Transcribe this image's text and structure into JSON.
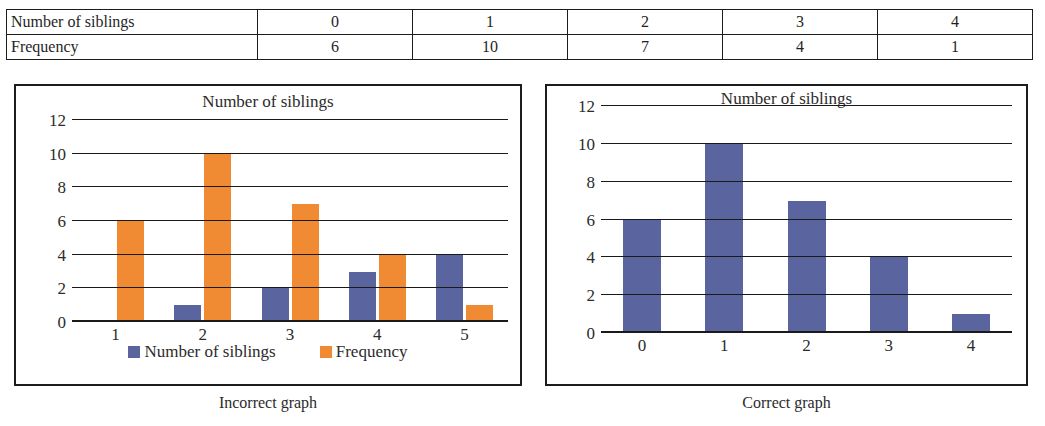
{
  "table": {
    "rows": [
      {
        "label": "Number of siblings",
        "values": [
          "0",
          "1",
          "2",
          "3",
          "4"
        ]
      },
      {
        "label": "Frequency",
        "values": [
          "6",
          "10",
          "7",
          "4",
          "1"
        ]
      }
    ]
  },
  "colors": {
    "blue": "#5a65a0",
    "orange": "#f08a33",
    "ink": "#1c1c1c"
  },
  "captions": {
    "left": "Incorrect graph",
    "right": "Correct graph"
  },
  "chart_data": [
    {
      "id": "incorrect",
      "type": "bar",
      "title": "Number of siblings",
      "xlabel": "",
      "ylabel": "",
      "categories": [
        "1",
        "2",
        "3",
        "4",
        "5"
      ],
      "yticks": [
        0,
        2,
        4,
        6,
        8,
        10,
        12
      ],
      "ylim": [
        0,
        12
      ],
      "grid": true,
      "legend": "bottom",
      "series": [
        {
          "name": "Number of siblings",
          "color": "#5a65a0",
          "values": [
            0,
            1,
            2,
            3,
            4
          ]
        },
        {
          "name": "Frequency",
          "color": "#f08a33",
          "values": [
            6,
            10,
            7,
            4,
            1
          ]
        }
      ]
    },
    {
      "id": "correct",
      "type": "bar",
      "title": "Number of siblings",
      "xlabel": "",
      "ylabel": "",
      "categories": [
        "0",
        "1",
        "2",
        "3",
        "4"
      ],
      "yticks": [
        0,
        2,
        4,
        6,
        8,
        10,
        12
      ],
      "ylim": [
        0,
        12
      ],
      "grid": true,
      "legend": "none",
      "series": [
        {
          "name": "Frequency",
          "color": "#5a65a0",
          "values": [
            6,
            10,
            7,
            4,
            1
          ]
        }
      ]
    }
  ]
}
